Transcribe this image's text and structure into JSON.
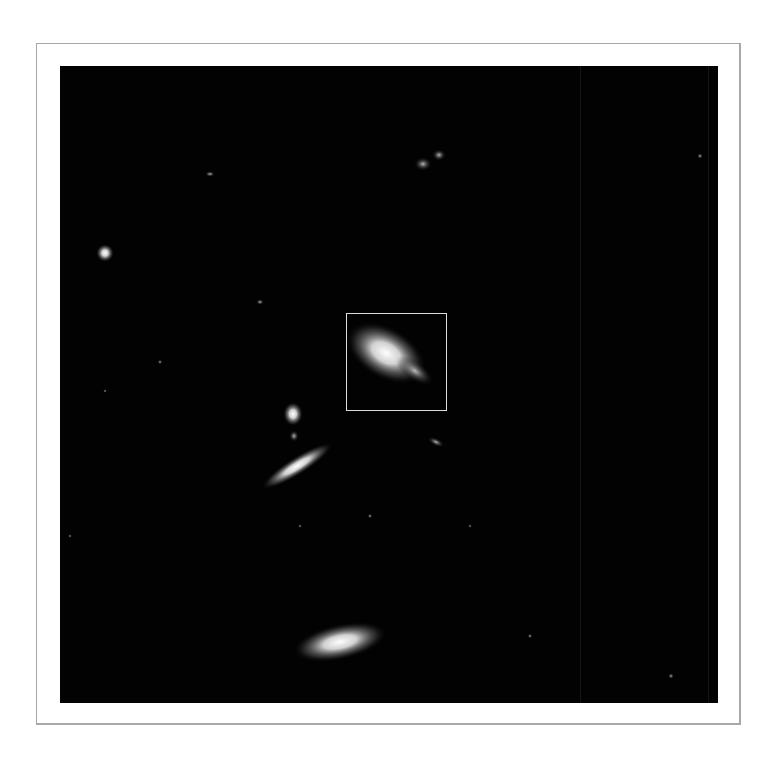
{
  "figure": {
    "highlight_box": {
      "label": "region-of-interest"
    },
    "caption": ""
  },
  "colors": {
    "background": "#ffffff",
    "frame_border": "#a8a8a8",
    "sky": "#020202",
    "highlight_box": "#dcdcdc"
  }
}
